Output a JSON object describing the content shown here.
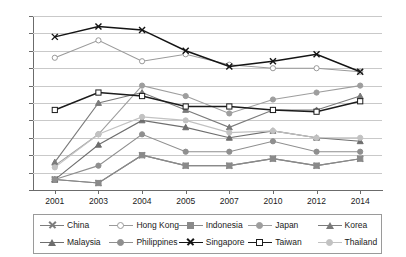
{
  "chart_data": {
    "type": "line",
    "title": "",
    "xlabel": "",
    "ylabel": "",
    "x": [
      "2001",
      "2003",
      "2004",
      "2005",
      "2007",
      "2010",
      "2012",
      "2014"
    ],
    "ylim": [
      30,
      80
    ],
    "ytick_step": 5,
    "yticks": [
      "30",
      "35",
      "40",
      "45",
      "50",
      "55",
      "60",
      "65",
      "70",
      "75",
      "80"
    ],
    "grid": true,
    "legend_position": "bottom",
    "series": [
      {
        "name": "China",
        "color": "#7d7d7d",
        "marker": "x",
        "values": [
          33,
          32,
          40,
          37,
          37,
          39,
          37,
          39
        ]
      },
      {
        "name": "Hong Kong",
        "color": "#9a9a9a",
        "marker": "circle",
        "values": [
          68,
          73,
          67,
          69,
          66,
          65,
          65,
          64
        ]
      },
      {
        "name": "Indonesia",
        "color": "#8a8a8a",
        "marker": "square",
        "values": [
          33,
          32,
          40,
          37,
          37,
          39,
          37,
          39
        ]
      },
      {
        "name": "Japan",
        "color": "#9e9e9e",
        "marker": "circle",
        "values": [
          37,
          46,
          60,
          57,
          52,
          56,
          58,
          60
        ]
      },
      {
        "name": "Korea",
        "color": "#7a7a7a",
        "marker": "triangle",
        "values": [
          38,
          55,
          58,
          53,
          48,
          53,
          53,
          57
        ]
      },
      {
        "name": "Malaysia",
        "color": "#6e6e6e",
        "marker": "triangle",
        "values": [
          33,
          43,
          50,
          48,
          45,
          47,
          45,
          44
        ]
      },
      {
        "name": "Philippines",
        "color": "#8f8f8f",
        "marker": "circle",
        "values": [
          33,
          37,
          46,
          41,
          41,
          44,
          41,
          41
        ]
      },
      {
        "name": "Singapore",
        "color": "#141414",
        "marker": "x",
        "values": [
          74,
          77,
          76,
          70,
          65.5,
          67,
          69,
          64
        ]
      },
      {
        "name": "Taiwan",
        "color": "#1c1c1c",
        "marker": "square",
        "values": [
          53,
          58,
          57,
          54,
          54,
          53,
          52.5,
          55.5
        ]
      },
      {
        "name": "Thailand",
        "color": "#c2c2c2",
        "marker": "circle",
        "values": [
          36.5,
          46,
          51,
          50,
          46.5,
          47,
          45,
          45
        ]
      }
    ]
  },
  "legend": {
    "row1": [
      "China",
      "Hong Kong",
      "Indonesia",
      "Japan",
      "Korea"
    ],
    "row2": [
      "Malaysia",
      "Philippines",
      "Singapore",
      "Taiwan",
      "Thailand"
    ]
  }
}
